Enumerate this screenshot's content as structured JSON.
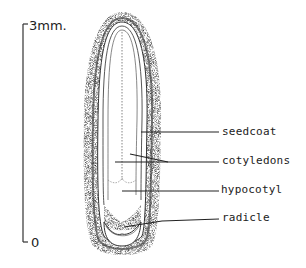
{
  "diagram": {
    "scale_bar": {
      "top_label": "3mm.",
      "bottom_label": "0"
    },
    "labels": [
      {
        "id": "seedcoat",
        "text": "seedcoat"
      },
      {
        "id": "cotyledons",
        "text": "cotyledons"
      },
      {
        "id": "hypocotyl",
        "text": "hypocotyl"
      },
      {
        "id": "radicle",
        "text": "radicle"
      }
    ],
    "colors": {
      "ink": "#222222",
      "stipple": "#333333",
      "background": "#ffffff"
    }
  }
}
